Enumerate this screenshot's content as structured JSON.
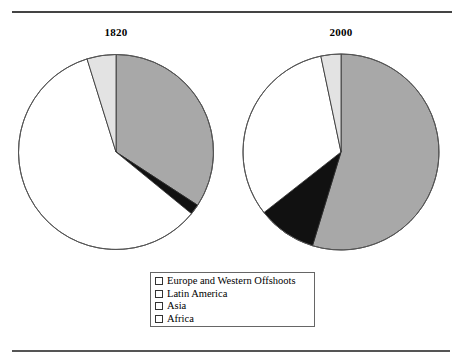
{
  "figure": {
    "name": "world-gdp-share-pie-pair",
    "rule_top": "horizontal-rule",
    "rule_bottom": "horizontal-rule"
  },
  "legend": {
    "items": [
      {
        "label": "Europe and Western Offshoots",
        "color": "#a8a8a8",
        "swatch": "gray-swatch"
      },
      {
        "label": "Latin America",
        "color": "#111111",
        "swatch": "black-swatch"
      },
      {
        "label": "Asia",
        "color": "#ffffff",
        "swatch": "white-swatch"
      },
      {
        "label": "Africa",
        "color": "#e3e3e3",
        "swatch": "light-gray-swatch"
      }
    ]
  },
  "chart_data": [
    {
      "type": "pie",
      "title": "1820",
      "categories": [
        "Europe and Western Offshoots",
        "Latin America",
        "Asia",
        "Africa"
      ],
      "values": [
        34.2,
        1.7,
        59.3,
        4.8
      ],
      "colors": [
        "#a8a8a8",
        "#111111",
        "#ffffff",
        "#e3e3e3"
      ],
      "start_angle": 0,
      "direction": "clockwise",
      "legend_position": "bottom-center"
    },
    {
      "type": "pie",
      "title": "2000",
      "categories": [
        "Europe and Western Offshoots",
        "Latin America",
        "Asia",
        "Africa"
      ],
      "values": [
        54.7,
        9.7,
        32.3,
        3.3
      ],
      "colors": [
        "#a8a8a8",
        "#111111",
        "#ffffff",
        "#e3e3e3"
      ],
      "start_angle": 0,
      "direction": "clockwise",
      "legend_position": "bottom-center"
    }
  ]
}
